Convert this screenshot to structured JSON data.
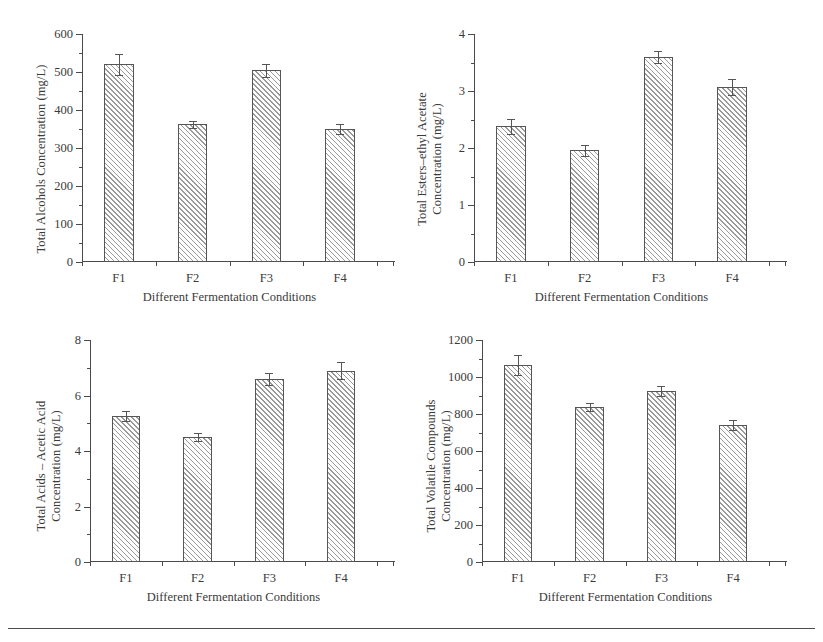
{
  "figure": {
    "categories": [
      "F1",
      "F2",
      "F3",
      "F4"
    ],
    "xaxis_title": "Different Fermentation Conditions"
  },
  "chart_data": [
    {
      "type": "bar",
      "panel": "top-left",
      "title": "",
      "xlabel": "Different Fermentation Conditions",
      "ylabel": "Total Alcohols Concentration (mg/L)",
      "ylabel_lines": [
        "Total Alcohols Concentration (mg/L)"
      ],
      "categories": [
        "F1",
        "F2",
        "F3",
        "F4"
      ],
      "values": [
        520,
        362,
        504,
        351
      ],
      "errors": [
        28,
        10,
        16,
        13
      ],
      "ylim": [
        0,
        600
      ],
      "yticks": [
        0,
        100,
        200,
        300,
        400,
        500,
        600
      ],
      "yticklabels": [
        "0",
        "100",
        "200",
        "300",
        "400",
        "500",
        "600"
      ],
      "minor_ticks": true,
      "grid": false,
      "legend": "none"
    },
    {
      "type": "bar",
      "panel": "top-right",
      "title": "",
      "xlabel": "Different Fermentation Conditions",
      "ylabel": "Total Esters–ethyl Acetate Concentration (mg/L)",
      "ylabel_lines": [
        "Total Esters–ethyl Acetate",
        "Concentration (mg/L)"
      ],
      "categories": [
        "F1",
        "F2",
        "F3",
        "F4"
      ],
      "values": [
        2.38,
        1.96,
        3.6,
        3.07
      ],
      "errors": [
        0.13,
        0.1,
        0.11,
        0.14
      ],
      "ylim": [
        0,
        4
      ],
      "yticks": [
        0,
        1,
        2,
        3,
        4
      ],
      "yticklabels": [
        "0",
        "1",
        "2",
        "3",
        "4"
      ],
      "minor_ticks": true,
      "grid": false,
      "legend": "none"
    },
    {
      "type": "bar",
      "panel": "bottom-left",
      "title": "",
      "xlabel": "Different Fermentation Conditions",
      "ylabel": "Total Acids – Acetic Acid Concentration (mg/L)",
      "ylabel_lines": [
        "Total Acids – Acetic Acid",
        "Concentration (mg/L)"
      ],
      "categories": [
        "F1",
        "F2",
        "F3",
        "F4"
      ],
      "values": [
        5.25,
        4.5,
        6.6,
        6.9
      ],
      "errors": [
        0.18,
        0.14,
        0.22,
        0.3
      ],
      "ylim": [
        0,
        8
      ],
      "yticks": [
        0,
        2,
        4,
        6,
        8
      ],
      "yticklabels": [
        "0",
        "2",
        "4",
        "6",
        "8"
      ],
      "minor_ticks": true,
      "grid": false,
      "legend": "none"
    },
    {
      "type": "bar",
      "panel": "bottom-right",
      "title": "",
      "xlabel": "Different Fermentation Conditions",
      "ylabel": "Total Volatile Compounds Concentration (mg/L)",
      "ylabel_lines": [
        "Total Volatile Compounds",
        "Concentration (mg/L)"
      ],
      "categories": [
        "F1",
        "F2",
        "F3",
        "F4"
      ],
      "values": [
        1065,
        840,
        925,
        740
      ],
      "errors": [
        55,
        22,
        25,
        25
      ],
      "ylim": [
        0,
        1200
      ],
      "yticks": [
        0,
        200,
        400,
        600,
        800,
        1000,
        1200
      ],
      "yticklabels": [
        "0",
        "200",
        "400",
        "600",
        "800",
        "1000",
        "1200"
      ],
      "minor_ticks": true,
      "grid": false,
      "legend": "none"
    }
  ]
}
